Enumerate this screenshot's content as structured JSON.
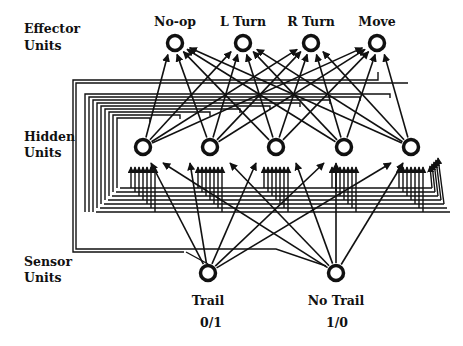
{
  "diagram": {
    "layers": {
      "effector": {
        "label_line1": "Effector",
        "label_line2": "Units"
      },
      "hidden": {
        "label_line1": "Hidden",
        "label_line2": "Units"
      },
      "sensor": {
        "label_line1": "Sensor",
        "label_line2": "Units"
      }
    },
    "effector_units": [
      {
        "label": "No-op",
        "x": 175,
        "y": 43
      },
      {
        "label": "L Turn",
        "x": 243,
        "y": 43
      },
      {
        "label": "R Turn",
        "x": 311,
        "y": 43
      },
      {
        "label": "Move",
        "x": 377,
        "y": 43
      }
    ],
    "hidden_units": [
      {
        "x": 143,
        "y": 147
      },
      {
        "x": 210,
        "y": 147
      },
      {
        "x": 276,
        "y": 147
      },
      {
        "x": 344,
        "y": 147
      },
      {
        "x": 411,
        "y": 147
      }
    ],
    "sensor_units": [
      {
        "label": "Trail",
        "value": "0/1",
        "x": 208,
        "y": 273
      },
      {
        "label": "No Trail",
        "value": "1/0",
        "x": 336,
        "y": 273
      }
    ],
    "colors": {
      "stroke": "#111111",
      "background": "#ffffff"
    }
  }
}
